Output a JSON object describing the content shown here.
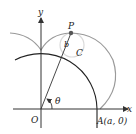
{
  "diagram": {
    "type": "epicycloid-construction",
    "labels": {
      "y_axis": "y",
      "x_axis": "x",
      "origin": "O",
      "point_p": "P",
      "radius_b": "b",
      "center_c": "C",
      "angle": "θ",
      "point_a": "A(a, 0)"
    },
    "colors": {
      "axes": "#333333",
      "fixed_circle": "#222222",
      "curve": "#9a9a9a",
      "rolling_circle": "#d8d8d8",
      "point": "#555555"
    }
  }
}
